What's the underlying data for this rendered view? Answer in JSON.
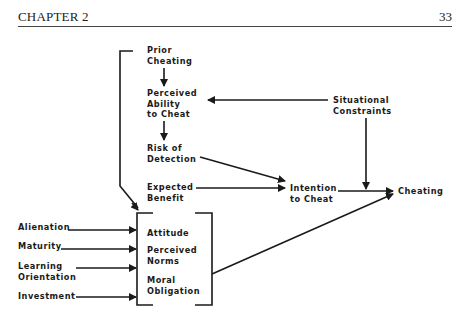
{
  "header": {
    "chapter": "CHAPTER 2",
    "page_number": "33"
  },
  "nodes": {
    "prior_cheating": "Prior\nCheating",
    "perceived_ability": "Perceived\nAbility\nto Cheat",
    "risk_of_detection": "Risk of\nDetection",
    "expected_benefit": "Expected\nBenefit",
    "situational_constraints": "Situational\nConstraints",
    "intention_to_cheat": "Intention\nto Cheat",
    "cheating": "Cheating",
    "alienation": "Alienation",
    "maturity": "Maturity",
    "learning_orientation": "Learning\nOrientation",
    "investment": "Investment",
    "attitude": "Attitude",
    "perceived_norms": "Perceived\nNorms",
    "moral_obligation": "Moral\nObligation"
  },
  "edges": [
    [
      "Prior Cheating",
      "Perceived Ability to Cheat"
    ],
    [
      "Situational Constraints",
      "Perceived Ability to Cheat"
    ],
    [
      "Perceived Ability to Cheat",
      "Risk of Detection"
    ],
    [
      "Risk of Detection",
      "Intention to Cheat"
    ],
    [
      "Expected Benefit",
      "Intention to Cheat"
    ],
    [
      "Situational Constraints",
      "Intention-Cheating path"
    ],
    [
      "Intention to Cheat",
      "Cheating"
    ],
    [
      "Prior Cheating",
      "Attitude/Norms/Obligation group"
    ],
    [
      "Alienation",
      "Attitude/Norms/Obligation group"
    ],
    [
      "Maturity",
      "Attitude/Norms/Obligation group"
    ],
    [
      "Learning Orientation",
      "Attitude/Norms/Obligation group"
    ],
    [
      "Investment",
      "Attitude/Norms/Obligation group"
    ],
    [
      "Attitude/Norms/Obligation group",
      "Cheating"
    ]
  ]
}
